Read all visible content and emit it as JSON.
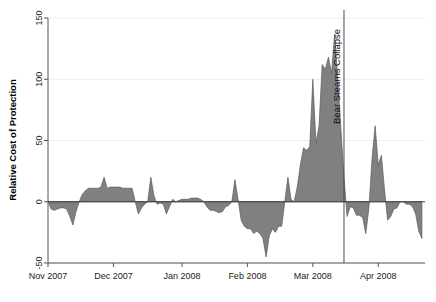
{
  "chart_data": {
    "type": "area",
    "title": "",
    "xlabel": "",
    "ylabel": "Relative Cost of Protection",
    "ylim": [
      -50,
      150
    ],
    "yticks": [
      -50,
      0,
      50,
      100,
      150
    ],
    "ytick_labels": [
      "-50",
      "0",
      "50",
      "100",
      "150"
    ],
    "grid": true,
    "legend": "none",
    "baseline": 0,
    "fill_color": "#808080",
    "line_color": "#5a5a5a",
    "xtick_labels": [
      "Nov 2007",
      "Dec 2007",
      "Jan 2008",
      "Feb 2008",
      "Mar 2008",
      "Apr 2008"
    ],
    "xtick_positions": [
      0,
      21,
      43,
      64,
      85,
      106
    ],
    "xlim": [
      0,
      121
    ],
    "annotations": [
      {
        "label": "Bear Stearns Collapse",
        "x": 95,
        "orientation": "vertical",
        "line": true
      }
    ],
    "x": [
      0,
      1,
      2,
      3,
      4,
      5,
      6,
      7,
      8,
      9,
      10,
      11,
      12,
      13,
      14,
      15,
      16,
      17,
      18,
      19,
      20,
      21,
      22,
      23,
      24,
      25,
      26,
      27,
      28,
      29,
      30,
      31,
      32,
      33,
      34,
      35,
      36,
      37,
      38,
      39,
      40,
      41,
      42,
      43,
      44,
      45,
      46,
      47,
      48,
      49,
      50,
      51,
      52,
      53,
      54,
      55,
      56,
      57,
      58,
      59,
      60,
      61,
      62,
      63,
      64,
      65,
      66,
      67,
      68,
      69,
      70,
      71,
      72,
      73,
      74,
      75,
      76,
      77,
      78,
      79,
      80,
      81,
      82,
      83,
      84,
      85,
      86,
      87,
      88,
      89,
      90,
      91,
      92,
      93,
      94,
      95,
      96,
      97,
      98,
      99,
      100,
      101,
      102,
      103,
      104,
      105,
      106,
      107,
      108,
      109,
      110,
      111,
      112,
      113,
      114,
      115,
      116,
      117,
      118,
      119,
      120
    ],
    "values": [
      0,
      -6,
      -7,
      -6,
      -5,
      -5,
      -6,
      -12,
      -19,
      -8,
      0,
      6,
      9,
      11,
      11,
      11,
      11,
      12,
      20,
      11,
      12,
      12,
      12,
      12,
      11,
      11,
      11,
      11,
      0,
      -10,
      -5,
      -2,
      0,
      20,
      5,
      -2,
      -1,
      -2,
      -10,
      -4,
      2,
      0,
      1,
      2,
      2,
      2,
      3,
      3,
      3,
      2,
      0,
      -4,
      -7,
      -7,
      -8,
      -9,
      -8,
      -4,
      -3,
      0,
      18,
      2,
      -15,
      -20,
      -22,
      -22,
      -26,
      -24,
      -26,
      -30,
      -45,
      -28,
      -22,
      -25,
      -20,
      -20,
      0,
      20,
      2,
      0,
      12,
      30,
      44,
      42,
      45,
      100,
      48,
      62,
      112,
      108,
      118,
      105,
      137,
      100,
      60,
      20,
      -12,
      -4,
      -5,
      -11,
      -11,
      -13,
      -26,
      -5,
      35,
      62,
      30,
      38,
      10,
      -15,
      -12,
      -6,
      -5,
      0,
      0,
      -2,
      -2,
      -4,
      -10,
      -24,
      -30
    ]
  },
  "axis": {
    "y_title": "Relative Cost of Protection"
  }
}
